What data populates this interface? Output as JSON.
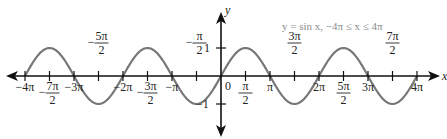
{
  "chart_data": {
    "type": "line",
    "title": "y = sin x, −4π ≤ x ≤ 4π",
    "xlabel": "x",
    "ylabel": "y",
    "function": "sin x",
    "xlim": [
      -12.566,
      12.566
    ],
    "ylim": [
      -1,
      1
    ],
    "x_ticks": [
      "−4π",
      "−7π/2",
      "−3π",
      "−5π/2",
      "−2π",
      "−3π/2",
      "−π",
      "−π/2",
      "0",
      "π/2",
      "π",
      "3π/2",
      "2π",
      "5π/2",
      "3π",
      "7π/2",
      "4π"
    ],
    "y_ticks": [
      "1",
      "−1"
    ],
    "series": [
      {
        "name": "y = sin x",
        "color": "#777777",
        "x": [
          -12.566,
          -10.996,
          -9.425,
          -7.854,
          -6.283,
          -4.712,
          -3.142,
          -1.571,
          0,
          1.571,
          3.142,
          4.712,
          6.283,
          7.854,
          9.425,
          10.996,
          12.566
        ],
        "values": [
          0,
          1,
          0,
          -1,
          0,
          1,
          0,
          -1,
          0,
          1,
          0,
          -1,
          0,
          1,
          0,
          -1,
          0
        ]
      }
    ],
    "grid": false,
    "legend": null
  },
  "labels": {
    "title": "y = sin x, −4π ≤ x ≤ 4π",
    "x_axis": "x",
    "y_axis": "y",
    "origin": "0",
    "y_one": "1",
    "y_neg_one": "−1"
  },
  "colors": {
    "curve": "#777777",
    "axis": "#111111",
    "title": "#8a8a8a"
  }
}
